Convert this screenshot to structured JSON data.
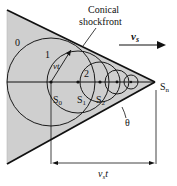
{
  "diagram": {
    "title_label": "Conical",
    "title_label_line2": "shockfront",
    "velocity_label": "v",
    "velocity_subscript": "s",
    "radius_label": "vt",
    "angle_label": "θ",
    "distance_label_v": "v",
    "distance_label_sub": "s",
    "distance_label_t": "t",
    "wavefront_labels": [
      "0",
      "1",
      "2"
    ],
    "source_labels": [
      {
        "base": "S",
        "sub": "0"
      },
      {
        "base": "S",
        "sub": "1"
      },
      {
        "base": "S",
        "sub": "2"
      },
      {
        "base": "S",
        "sub": "n"
      }
    ],
    "colors": {
      "cone_fill": "#cfcfcf",
      "lines": "#1a1a1a",
      "background": "#ffffff"
    }
  }
}
